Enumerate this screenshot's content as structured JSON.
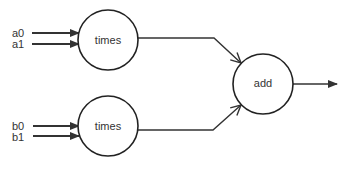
{
  "diagram": {
    "type": "dataflow-graph",
    "nodes": [
      {
        "id": "times1",
        "label": "times",
        "cx": 108,
        "cy": 40,
        "r": 30
      },
      {
        "id": "times2",
        "label": "times",
        "cx": 108,
        "cy": 126,
        "r": 30
      },
      {
        "id": "add",
        "label": "add",
        "cx": 263,
        "cy": 84,
        "r": 30
      }
    ],
    "inputs": [
      {
        "id": "a0",
        "label": "a0",
        "target": "times1",
        "y": 33
      },
      {
        "id": "a1",
        "label": "a1",
        "target": "times1",
        "y": 44
      },
      {
        "id": "b0",
        "label": "b0",
        "target": "times2",
        "y": 126
      },
      {
        "id": "b1",
        "label": "b1",
        "target": "times2",
        "y": 136
      }
    ],
    "edges": [
      {
        "from": "times1",
        "to": "add"
      },
      {
        "from": "times2",
        "to": "add"
      },
      {
        "from": "add",
        "to": "output"
      }
    ],
    "colors": {
      "stroke": "#222222",
      "text": "#333333",
      "background": "#ffffff"
    }
  }
}
